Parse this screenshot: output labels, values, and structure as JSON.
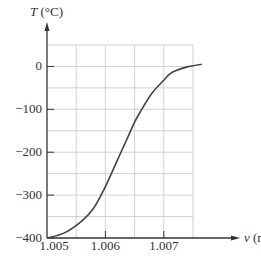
{
  "chart_data": {
    "type": "line",
    "title": "",
    "xlabel": "v (mV)",
    "ylabel": "T (°C)",
    "xlabel_var": "v",
    "xlabel_unit": " (mV)",
    "ylabel_var": "T",
    "ylabel_unit": " (°C)",
    "xlim": [
      1.005,
      1.0075
    ],
    "ylim": [
      -400,
      50
    ],
    "x_ticks": [
      1.005,
      1.006,
      1.007
    ],
    "x_tick_labels": [
      "1.005",
      "1.006",
      "1.007"
    ],
    "y_ticks": [
      0,
      -100,
      -200,
      -300,
      -400
    ],
    "y_tick_labels": [
      "0",
      "−100",
      "−200",
      "−300",
      "−400"
    ],
    "grid": true,
    "grid_x_step": 0.0005,
    "grid_y_step": 50,
    "legend": null,
    "series": [
      {
        "name": "T vs v",
        "color": "#444444",
        "x": [
          1.005,
          1.0053,
          1.0056,
          1.0058,
          1.006,
          1.0062,
          1.0064,
          1.0065,
          1.0066,
          1.0068,
          1.007,
          1.0071,
          1.0072,
          1.0074,
          1.00765
        ],
        "y": [
          -400,
          -388,
          -360,
          -330,
          -280,
          -220,
          -160,
          -130,
          -105,
          -62,
          -32,
          -18,
          -10,
          -1,
          5
        ]
      }
    ]
  },
  "colors": {
    "axis": "#333333",
    "grid": "#cccccc",
    "curve": "#444444",
    "background": "#ffffff"
  }
}
